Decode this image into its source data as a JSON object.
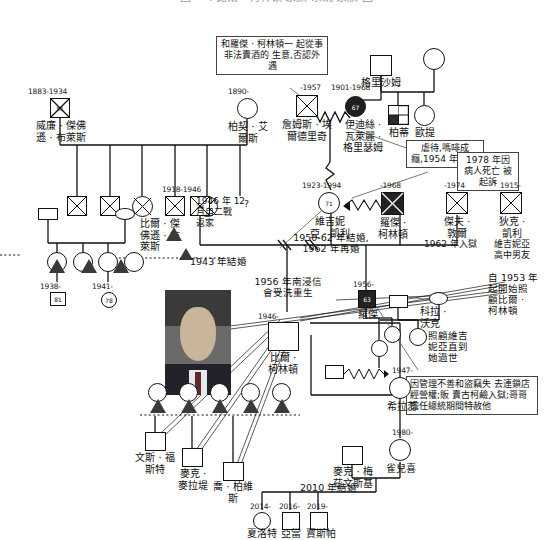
{
  "title": "圖 一 : 比爾 · 柯林頓 家族 系統 家族 圖",
  "people": {
    "william_blythe": {
      "years": "1883-1934",
      "age": "51",
      "name": "威廉 · 傑佛\n遜 · 布萊斯"
    },
    "birchie_ayers": {
      "years": "1890-",
      "name": "柏契 · 艾\n爾斯"
    },
    "james_eldridge": {
      "years": "-1957",
      "name": "詹姆斯 · 埃\n爾德里奇"
    },
    "edith_grisham": {
      "years": "1901-1968",
      "age": "67",
      "name": "伊迪絲 ·\n瓦萊麗 ·\n格里瑟姆"
    },
    "grisham": {
      "name": "格里沙姆"
    },
    "patty": {
      "name": "柏蒂"
    },
    "otie": {
      "name": "歐提"
    },
    "bill_blythe_jr": {
      "years": "1918-1946",
      "age": "28",
      "name": "比爾 · 傑\n佛遜 · 布\n萊斯"
    },
    "virginia": {
      "years": "1923-1994",
      "age": "71",
      "name": "維吉妮\n亞 · 凱利"
    },
    "roger_clinton": {
      "years": "-1968",
      "name": "羅傑 ·\n柯林頓"
    },
    "jeff_dwire": {
      "years": "-1974",
      "name": "傑夫 ·\n敦爾"
    },
    "dick_kelley": {
      "years": "1915-",
      "name": "狄克 ·\n凱利"
    },
    "cora_walker": {
      "name": "科拉 ·\n沃克"
    },
    "bill_clinton": {
      "years": "1946-",
      "name": "比爾 ·\n柯林頓"
    },
    "roger_jr": {
      "years": "1956-",
      "age": "63",
      "name": "羅傑"
    },
    "hillary": {
      "years": "1947-",
      "name": "希拉蕊"
    },
    "chelsea": {
      "years": "1980-",
      "name": "雀兒喜"
    },
    "marc": {
      "name": "麥克 · 梅\n茲文斯基"
    },
    "vince_foster": {
      "name": "文斯 · 福\n斯特"
    },
    "mack_mclarty": {
      "name": "麥克 ·\n麥拉堤"
    },
    "joe_purvis": {
      "name": "喬 · 柏維\n斯"
    },
    "child_1938": {
      "years": "1938-",
      "age": "81"
    },
    "child_1941": {
      "years": "1941-",
      "age": "78"
    },
    "charlotte": {
      "years": "2014-",
      "name": "夏洛特"
    },
    "aidan": {
      "years": "2016-",
      "name": "亞當"
    },
    "jasper": {
      "years": "2019-",
      "name": "賈斯帕"
    },
    "unknown_marker": {
      "label": "?"
    }
  },
  "notes": {
    "bootleg": "和羅傑 · 柯林頓一\n起從事非法賣酒的\n生意,否認外遇",
    "abuse": "虐待,嗎啡成\n癮,1954 年\n中風",
    "lawsuit": "1978 年因\n病人死亡\n被起訴",
    "caretaker": "自 1953 年\n起開始照\n顧比爾 ·\n柯林頓",
    "nursed": "照顧維吉\n妮亞直到\n她過世",
    "roger_jr_note": "因管理不善和盜竊失\n去連鎖店經營權;販\n賣古柯鹼入獄;哥哥\n擔任總統期間特赦他"
  },
  "labels": {
    "married_1943": "1943 年結婚",
    "returned_1946": "1946 年 12\n月自二戰\n返家",
    "married_1950_62": "1950-62 年結婚,\n1962 年再婚",
    "jailed_1962": "1962 年入獄",
    "hs_boyfriend": "維吉妮亞\n高中男友",
    "baptized_1956": "1956 年南浸信\n會受洗重生",
    "married_2010": "2010 年結婚"
  },
  "colors": {
    "line": "#111111",
    "fill_dark": "#2a2a2a",
    "note_border": "#444444"
  }
}
